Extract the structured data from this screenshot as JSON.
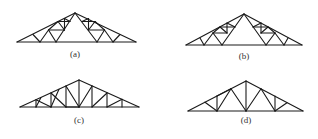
{
  "figure": {
    "type": "roof-truss-configurations",
    "panels": [
      {
        "id": "a",
        "label": "(a)",
        "label_pos": [
          75,
          53
        ],
        "members": [
          [
            17,
            42,
            136,
            42
          ],
          [
            17,
            42,
            75,
            13
          ],
          [
            75,
            13,
            136,
            42
          ],
          [
            33,
            34.5,
            40,
            42
          ],
          [
            40,
            42,
            48.5,
            30
          ],
          [
            48.5,
            30,
            56,
            42
          ],
          [
            56,
            42,
            75,
            13
          ],
          [
            48.5,
            30,
            64.5,
            30
          ],
          [
            64.5,
            30,
            64.5,
            18.5
          ],
          [
            48.5,
            30,
            58,
            21.5
          ],
          [
            58,
            21.5,
            64.5,
            30
          ],
          [
            58,
            21.5,
            70,
            21.5
          ],
          [
            64.5,
            18.5,
            70,
            21.5
          ],
          [
            120,
            34.5,
            113,
            42
          ],
          [
            113,
            42,
            104.5,
            30
          ],
          [
            104.5,
            30,
            97,
            42
          ],
          [
            97,
            42,
            75,
            13
          ],
          [
            104.5,
            30,
            88.5,
            30
          ],
          [
            88.5,
            30,
            88.5,
            18.5
          ],
          [
            104.5,
            30,
            95,
            21.5
          ],
          [
            95,
            21.5,
            88.5,
            30
          ],
          [
            95,
            21.5,
            82,
            21.5
          ],
          [
            88.5,
            18.5,
            82,
            21.5
          ]
        ]
      },
      {
        "id": "b",
        "label": "(b)",
        "label_pos": [
          244,
          55
        ],
        "members": [
          [
            186,
            45,
            302,
            45
          ],
          [
            186,
            45,
            244,
            14
          ],
          [
            244,
            14,
            302,
            45
          ],
          [
            200,
            38,
            204,
            45
          ],
          [
            204,
            45,
            213,
            33
          ],
          [
            213,
            33,
            222,
            45
          ],
          [
            222,
            45,
            244,
            14
          ],
          [
            213,
            33,
            227,
            33
          ],
          [
            227,
            33,
            227,
            23
          ],
          [
            213,
            33,
            220,
            27
          ],
          [
            220,
            27,
            227,
            33
          ],
          [
            220,
            27,
            235,
            27
          ],
          [
            227,
            23,
            235,
            27
          ],
          [
            288,
            38,
            284,
            45
          ],
          [
            284,
            45,
            275,
            33
          ],
          [
            275,
            33,
            266,
            45
          ],
          [
            266,
            45,
            244,
            14
          ],
          [
            275,
            33,
            261,
            33
          ],
          [
            261,
            33,
            261,
            23
          ],
          [
            275,
            33,
            268,
            27
          ],
          [
            268,
            27,
            261,
            33
          ],
          [
            268,
            27,
            253,
            27
          ],
          [
            261,
            23,
            253,
            27
          ]
        ]
      },
      {
        "id": "c",
        "label": "(c)",
        "label_pos": [
          79,
          119
        ],
        "members": [
          [
            20,
            107,
            139,
            107
          ],
          [
            20,
            107,
            79,
            80
          ],
          [
            79,
            80,
            139,
            107
          ],
          [
            36,
            107,
            36,
            99.7
          ],
          [
            36,
            107,
            41,
            97.5
          ],
          [
            51,
            107,
            51,
            93
          ],
          [
            51,
            107,
            59,
            89.2
          ],
          [
            66,
            107,
            66,
            86
          ],
          [
            66,
            107,
            79,
            107
          ],
          [
            79,
            107,
            79,
            80
          ],
          [
            66,
            86,
            79,
            107
          ],
          [
            51,
            93,
            66,
            107
          ],
          [
            36,
            99.7,
            51,
            107
          ],
          [
            92,
            107,
            92,
            86
          ],
          [
            92,
            86,
            79,
            107
          ],
          [
            107,
            107,
            107,
            93
          ],
          [
            107,
            93,
            92,
            107
          ],
          [
            122,
            107,
            122,
            99.3
          ],
          [
            122,
            99.3,
            107,
            107
          ]
        ]
      },
      {
        "id": "d",
        "label": "(d)",
        "label_pos": [
          246,
          119
        ],
        "members": [
          [
            188,
            111,
            303,
            111
          ],
          [
            188,
            111,
            246,
            81
          ],
          [
            246,
            81,
            303,
            111
          ],
          [
            205,
            102.2,
            217,
            111
          ],
          [
            217,
            111,
            217,
            96
          ],
          [
            217,
            96,
            231,
            88.8
          ],
          [
            217,
            111,
            231,
            88.8
          ],
          [
            231,
            88.8,
            246,
            111
          ],
          [
            246,
            111,
            246,
            81
          ],
          [
            287,
            102.7,
            275,
            111
          ],
          [
            275,
            111,
            275,
            96
          ],
          [
            275,
            111,
            261,
            88.8
          ],
          [
            261,
            88.8,
            246,
            111
          ]
        ]
      }
    ]
  }
}
